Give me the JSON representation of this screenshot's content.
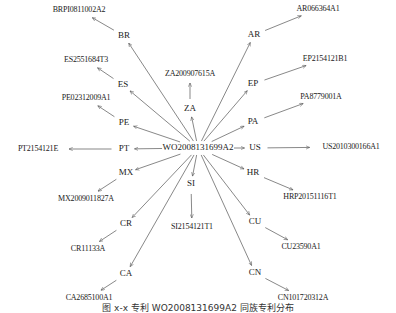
{
  "diagram": {
    "root": {
      "id": "root",
      "label": "WO2008131699A2",
      "x": 198,
      "y": 148
    },
    "branches": [
      {
        "country": "BR",
        "cx": 124,
        "cy": 36,
        "patent": "BRPI0811002A2",
        "px": 79,
        "py": 10
      },
      {
        "country": "AR",
        "cx": 254,
        "cy": 35,
        "patent": "AR066364A1",
        "px": 318,
        "py": 9
      },
      {
        "country": "ZA",
        "cx": 190,
        "cy": 109,
        "patent": "ZA200907615A",
        "px": 190,
        "py": 74
      },
      {
        "country": "ES",
        "cx": 123,
        "cy": 85,
        "patent": "ES2551684T3",
        "px": 86,
        "py": 60
      },
      {
        "country": "EP",
        "cx": 253,
        "cy": 84,
        "patent": "EP2154121B1",
        "px": 325,
        "py": 59
      },
      {
        "country": "PE",
        "cx": 124,
        "cy": 123,
        "patent": "PE02312009A1",
        "px": 86,
        "py": 98
      },
      {
        "country": "PA",
        "cx": 253,
        "cy": 122,
        "patent": "PA8779001A",
        "px": 321,
        "py": 97
      },
      {
        "country": "PT",
        "cx": 124,
        "cy": 149,
        "patent": "PT2154121E",
        "px": 38,
        "py": 149
      },
      {
        "country": "US",
        "cx": 255,
        "cy": 148,
        "patent": "US2010300166A1",
        "px": 351,
        "py": 147
      },
      {
        "country": "MX",
        "cx": 126,
        "cy": 173,
        "patent": "MX2009011827A",
        "px": 86,
        "py": 199
      },
      {
        "country": "HR",
        "cx": 253,
        "cy": 173,
        "patent": "HRP20151116T1",
        "px": 310,
        "py": 197
      },
      {
        "country": "SI",
        "cx": 191,
        "cy": 184,
        "patent": "SI2154121T1",
        "px": 192,
        "py": 227
      },
      {
        "country": "CR",
        "cx": 126,
        "cy": 224,
        "patent": "CR11133A",
        "px": 88,
        "py": 249
      },
      {
        "country": "CU",
        "cx": 255,
        "cy": 222,
        "patent": "CU23590A1",
        "px": 301,
        "py": 247
      },
      {
        "country": "CA",
        "cx": 126,
        "cy": 274,
        "patent": "CA2685100A1",
        "px": 89,
        "py": 298
      },
      {
        "country": "CN",
        "cx": 255,
        "cy": 273,
        "patent": "CN101720312A",
        "px": 303,
        "py": 298
      }
    ]
  },
  "caption": {
    "text": "图 x-x  专利 WO2008131699A2 同族专利分布"
  },
  "colors": {
    "edge": "#555555",
    "text": "#1a1a1a",
    "background": "#ffffff"
  }
}
